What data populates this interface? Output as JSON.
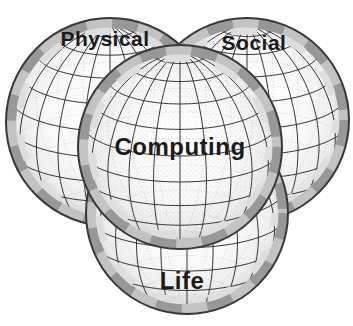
{
  "diagram": {
    "spheres": [
      {
        "id": "physical",
        "label": "Physical"
      },
      {
        "id": "social",
        "label": "Social"
      },
      {
        "id": "life",
        "label": "Life"
      },
      {
        "id": "computing",
        "label": "Computing"
      }
    ],
    "colors": {
      "background": "#ffffff",
      "grid_line": "#333333",
      "back_line": "#9a9a9a",
      "rim_shade": "#989898",
      "sphere_fill": "#ffffff",
      "label_text": "#1b1b1b"
    }
  }
}
